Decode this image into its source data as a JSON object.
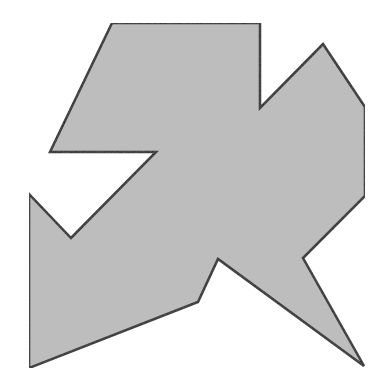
{
  "diagram": {
    "type": "polygon",
    "fill": "#bdbdbd",
    "stroke": "#222222",
    "stroke_width": 2.5,
    "vertices": [
      [
        112,
        23
      ],
      [
        260,
        23
      ],
      [
        260,
        108
      ],
      [
        323,
        44
      ],
      [
        365,
        107
      ],
      [
        365,
        196
      ],
      [
        303,
        258
      ],
      [
        364,
        366
      ],
      [
        218,
        259
      ],
      [
        198,
        302
      ],
      [
        29,
        368
      ],
      [
        29,
        194
      ],
      [
        71,
        238
      ],
      [
        156,
        152
      ],
      [
        50,
        152
      ]
    ]
  }
}
